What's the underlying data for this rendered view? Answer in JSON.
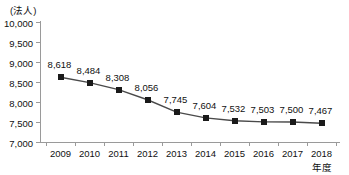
{
  "chart_data": {
    "type": "line",
    "title": "",
    "unit_caption": "(法人)",
    "xlabel": "年度",
    "ylabel": "",
    "categories": [
      "2009",
      "2010",
      "2011",
      "2012",
      "2013",
      "2014",
      "2015",
      "2016",
      "2017",
      "2018"
    ],
    "values": [
      8618,
      8484,
      8308,
      8056,
      7745,
      7604,
      7532,
      7503,
      7500,
      7467
    ],
    "point_labels": [
      "8,618",
      "8,484",
      "8,308",
      "8,056",
      "7,745",
      "7,604",
      "7,532",
      "7,503",
      "7,500",
      "7,467"
    ],
    "ylim": [
      7000,
      10000
    ],
    "ytick_values": [
      10000,
      9500,
      9000,
      8500,
      8000,
      7500,
      7000
    ],
    "ytick_labels": [
      "10,000",
      "9,500",
      "9,000",
      "8,500",
      "8,000",
      "7,500",
      "7,000"
    ],
    "grid": false,
    "legend": false,
    "series": [
      {
        "name": "",
        "marker": "square",
        "marker_color": "#1a1a1a",
        "line_color": "#4a4a4a",
        "values": [
          8618,
          8484,
          8308,
          8056,
          7745,
          7604,
          7532,
          7503,
          7500,
          7467
        ]
      }
    ],
    "colors": {
      "axis": "#9a9a9a",
      "text": "#111111",
      "marker": "#1a1a1a",
      "line": "#4a4a4a",
      "background": "#ffffff"
    }
  }
}
